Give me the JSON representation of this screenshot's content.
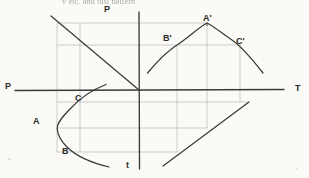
{
  "page": {
    "background_color": "#fbfaf7",
    "ink_color": "#3a3a3a",
    "grid_color": "#9c9c9c",
    "cutoff_text": "y  etc.  and  just  pattern"
  },
  "axes": {
    "horizontal": {
      "left_label": "P",
      "right_label": "T",
      "y": 90,
      "x_start": 15,
      "x_end": 284
    },
    "vertical": {
      "top_label": "P",
      "bottom_label": "t",
      "x": 139,
      "y_start": 12,
      "y_end": 169
    },
    "origin": {
      "x": 139,
      "y": 90
    }
  },
  "labels": [
    {
      "name": "label-P-top",
      "text": "P",
      "x": 104,
      "y": 5,
      "size": "md"
    },
    {
      "name": "label-P-left",
      "text": "P",
      "x": 5,
      "y": 82,
      "size": "md"
    },
    {
      "name": "label-T-right",
      "text": "T",
      "x": 295,
      "y": 84,
      "size": "md"
    },
    {
      "name": "label-t-bottom",
      "text": "t",
      "x": 126,
      "y": 161,
      "size": "md"
    },
    {
      "name": "label-A",
      "text": "A",
      "x": 33,
      "y": 117,
      "size": "md"
    },
    {
      "name": "label-B",
      "text": "B",
      "x": 62,
      "y": 147,
      "size": "md"
    },
    {
      "name": "label-C",
      "text": "C",
      "x": 75,
      "y": 94,
      "size": "md"
    },
    {
      "name": "label-A-prime",
      "text": "A'",
      "x": 203,
      "y": 14,
      "size": "md"
    },
    {
      "name": "label-B-prime",
      "text": "B'",
      "x": 163,
      "y": 34,
      "size": "md"
    },
    {
      "name": "label-C-prime",
      "text": "C'",
      "x": 236,
      "y": 37,
      "size": "md"
    }
  ],
  "chart_data": {
    "type": "line",
    "title": "",
    "xlabel": "T",
    "ylabel": "P",
    "grid": true,
    "legend": "none",
    "series": [
      {
        "name": "left-parabola-ABC",
        "type": "parabola-opens-right",
        "points": [
          {
            "label": "",
            "x": 106,
            "y": 85
          },
          {
            "label": "C",
            "x": 80,
            "y": 102
          },
          {
            "label": "",
            "x": 57,
            "y": 128
          },
          {
            "label": "B",
            "x": 80,
            "y": 152
          },
          {
            "label": "",
            "x": 109,
            "y": 167
          }
        ]
      },
      {
        "name": "right-parabola-ABC-prime",
        "type": "parabola-opens-down",
        "points": [
          {
            "label": "",
            "x": 148,
            "y": 73
          },
          {
            "label": "B'",
            "x": 177,
            "y": 45
          },
          {
            "label": "A'",
            "x": 207,
            "y": 23
          },
          {
            "label": "C'",
            "x": 240,
            "y": 45
          },
          {
            "label": "",
            "x": 263,
            "y": 73
          }
        ]
      }
    ],
    "straight_lines": [
      {
        "name": "diagonal-upper-left",
        "x1": 51,
        "y1": 16,
        "x2": 139,
        "y2": 90
      },
      {
        "name": "diagonal-lower-right",
        "x1": 163,
        "y1": 166,
        "x2": 249,
        "y2": 102
      }
    ],
    "grid_lines": {
      "horizontal": [
        {
          "y": 23,
          "x1": 57,
          "x2": 208
        },
        {
          "y": 45,
          "x1": 57,
          "x2": 241
        },
        {
          "y": 102,
          "x1": 57,
          "x2": 249
        },
        {
          "y": 128,
          "x1": 57,
          "x2": 208
        },
        {
          "y": 152,
          "x1": 57,
          "x2": 178
        }
      ],
      "vertical": [
        {
          "x": 57,
          "y1": 23,
          "y2": 152
        },
        {
          "x": 80,
          "y1": 23,
          "y2": 152
        },
        {
          "x": 177,
          "y1": 45,
          "y2": 152
        },
        {
          "x": 207,
          "y1": 23,
          "y2": 128
        },
        {
          "x": 240,
          "y1": 45,
          "y2": 102
        }
      ]
    }
  }
}
